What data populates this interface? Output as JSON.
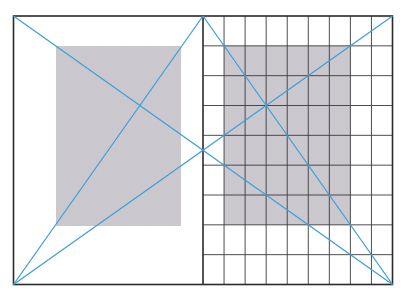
{
  "diagram": {
    "colors": {
      "background": "#ffffff",
      "frame": "#2a2a2a",
      "grid": "#3a3a3a",
      "text_block": "#c9c6cc",
      "construction_lines": "#3fa0d8"
    },
    "spread": {
      "x0": 13.5,
      "y0": 16,
      "x1": 392.5,
      "y1": 284.5,
      "spine_x": 203
    },
    "left_page": {
      "text_block": {
        "x": 56,
        "y": 46,
        "w": 125,
        "h": 180
      }
    },
    "right_page": {
      "grid": {
        "columns": 9,
        "rows": 9
      },
      "text_block": {
        "col_start": 1,
        "col_end": 7,
        "row_start": 1,
        "row_end": 7
      }
    },
    "construction_lines": [
      {
        "name": "spread-diagonal-tl-br",
        "from": [
          13.5,
          16
        ],
        "to": [
          392.5,
          284.5
        ]
      },
      {
        "name": "spread-diagonal-bl-tr",
        "from": [
          13.5,
          284.5
        ],
        "to": [
          392.5,
          16
        ]
      },
      {
        "name": "left-page-diagonal",
        "from": [
          13.5,
          284.5
        ],
        "to": [
          203,
          16
        ]
      },
      {
        "name": "right-page-diagonal",
        "from": [
          203,
          16
        ],
        "to": [
          392.5,
          284.5
        ]
      }
    ]
  }
}
